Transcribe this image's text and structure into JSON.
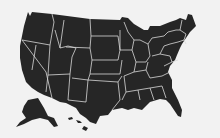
{
  "map": {
    "title": "United States",
    "colors": {
      "background": "#f2f2f2",
      "land": "#262626",
      "borders": "#d8d8d8"
    },
    "regions": [
      "contiguous-us",
      "alaska",
      "hawaii"
    ]
  }
}
